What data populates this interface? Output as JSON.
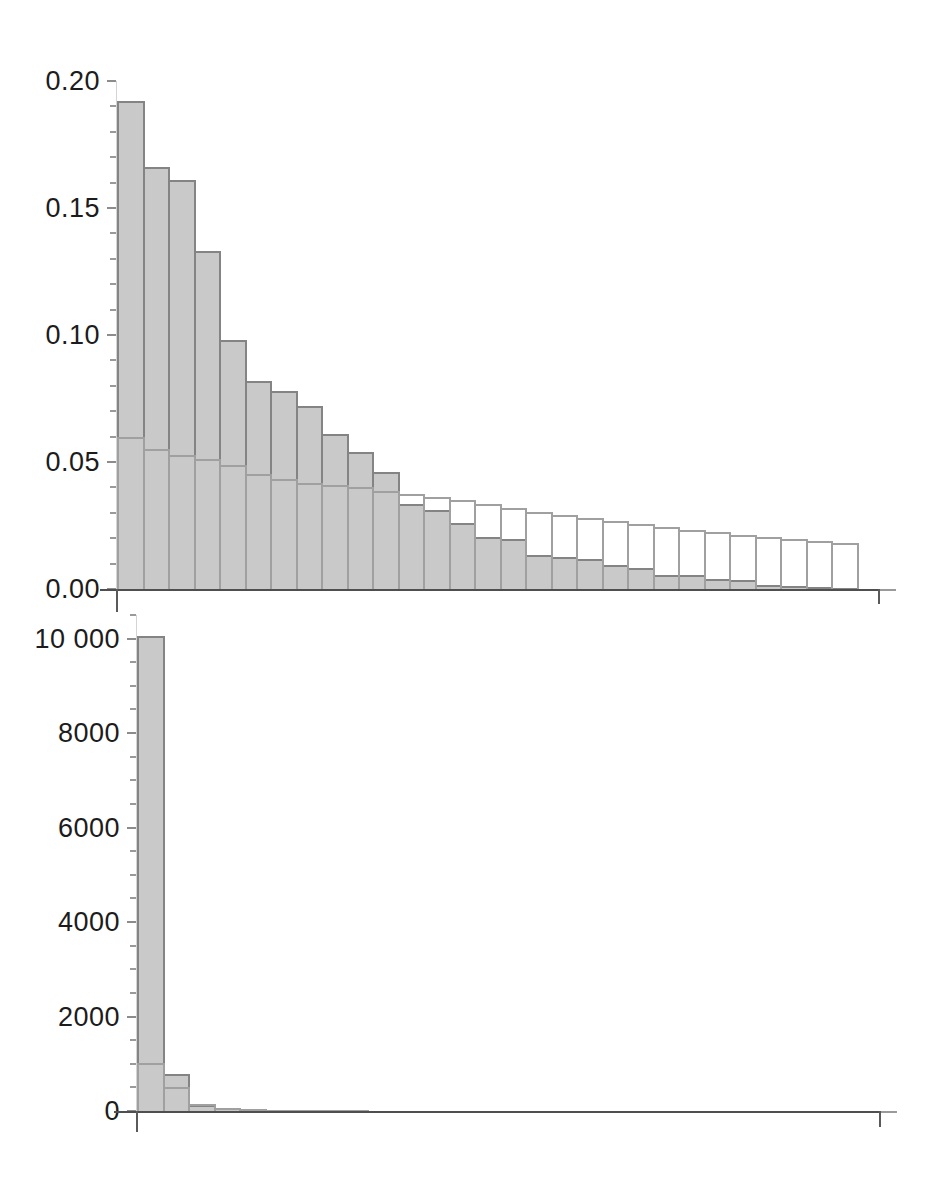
{
  "figure": {
    "background": "#ffffff"
  },
  "colors": {
    "background": "#ffffff",
    "bar_fill": "#c9c9c9",
    "bar_edge": "#848484",
    "outline_edge": "#a0a0a0",
    "axis": "#4f4f4f",
    "tick": "#9a9a9a",
    "text": "#1c1c1c"
  },
  "chart_data": [
    {
      "type": "bar",
      "id": "top",
      "title": "",
      "xlabel": "",
      "ylabel": "",
      "bins": 29,
      "ylim": [
        0,
        0.2
      ],
      "yticks": [
        0,
        0.05,
        0.1,
        0.15,
        0.2
      ],
      "ytick_labels": [
        "0.00",
        "0.05",
        "0.10",
        "0.15",
        "0.20"
      ],
      "major_tick_step": 0.05,
      "minor_tick_step": 0.01,
      "minor_tick_max": 0.2,
      "grid": false,
      "legend_position": "none",
      "series": [
        {
          "name": "observed-relative-frequency",
          "style": "filled",
          "values": [
            0.192,
            0.166,
            0.161,
            0.133,
            0.098,
            0.082,
            0.078,
            0.072,
            0.061,
            0.054,
            0.046,
            0.0335,
            0.031,
            0.026,
            0.0205,
            0.0197,
            0.0135,
            0.0125,
            0.012,
            0.0095,
            0.0082,
            0.0056,
            0.0054,
            0.004,
            0.0034,
            0.0017,
            0.001,
            0.0006,
            0.0003
          ]
        },
        {
          "name": "fitted-relative-frequency",
          "style": "outline",
          "values": [
            0.0598,
            0.0553,
            0.0528,
            0.0512,
            0.0489,
            0.0451,
            0.0432,
            0.0417,
            0.0409,
            0.0401,
            0.0386,
            0.0375,
            0.0363,
            0.0351,
            0.0336,
            0.0317,
            0.0304,
            0.0292,
            0.0278,
            0.0269,
            0.0257,
            0.0245,
            0.0234,
            0.0225,
            0.0214,
            0.0205,
            0.0197,
            0.019,
            0.0183
          ]
        }
      ]
    },
    {
      "type": "bar",
      "id": "bottom",
      "title": "",
      "xlabel": "",
      "ylabel": "",
      "bins": 29,
      "ylim": [
        0,
        10500
      ],
      "yticks": [
        0,
        2000,
        4000,
        6000,
        8000,
        10000
      ],
      "ytick_labels": [
        "0",
        "2000",
        "4000",
        "6000",
        "8000",
        "10 000"
      ],
      "major_tick_step": 2000,
      "minor_tick_step": 500,
      "minor_tick_max": 10500,
      "grid": false,
      "legend_position": "none",
      "series": [
        {
          "name": "observed-absolute-frequency",
          "style": "filled",
          "values": [
            10050,
            780,
            120,
            55,
            35,
            25,
            18,
            14,
            11,
            9,
            8,
            7,
            6,
            5,
            5,
            4,
            4,
            3,
            3,
            3,
            2,
            2,
            2,
            2,
            2,
            1,
            1,
            1,
            1
          ]
        },
        {
          "name": "fitted-absolute-frequency",
          "style": "outline",
          "values": [
            1020,
            510,
            140,
            65,
            38,
            27,
            20,
            15,
            12,
            10,
            9,
            8,
            7,
            6,
            5,
            5,
            4,
            4,
            3,
            3,
            3,
            2,
            2,
            2,
            2,
            2,
            1,
            1,
            1
          ]
        }
      ]
    }
  ]
}
